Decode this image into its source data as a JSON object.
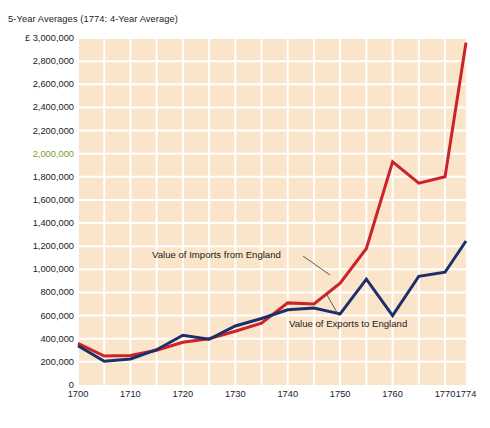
{
  "subtitle": "5-Year Averages (1774: 4-Year Average)",
  "colors": {
    "plot_background": "#fae5ca",
    "gridline": "#ffffff",
    "imports_line": "#cc2229",
    "exports_line": "#1d2f6b",
    "text": "#1b1b1b",
    "highlight_label": "#7a9b2e",
    "page_background": "#ffffff"
  },
  "axes": {
    "y_currency_prefix": "£",
    "y_ticks": [
      {
        "label": "£ 3,000,000",
        "value": 3000000,
        "highlighted": false
      },
      {
        "label": "2,800,000",
        "value": 2800000,
        "highlighted": false
      },
      {
        "label": "2,600,000",
        "value": 2600000,
        "highlighted": false
      },
      {
        "label": "2,400,000",
        "value": 2400000,
        "highlighted": false
      },
      {
        "label": "2,200,000",
        "value": 2200000,
        "highlighted": false
      },
      {
        "label": "2,000,000",
        "value": 2000000,
        "highlighted": true
      },
      {
        "label": "1,800,000",
        "value": 1800000,
        "highlighted": false
      },
      {
        "label": "1,600,000",
        "value": 1600000,
        "highlighted": false
      },
      {
        "label": "1,400,000",
        "value": 1400000,
        "highlighted": false
      },
      {
        "label": "1,200,000",
        "value": 1200000,
        "highlighted": false
      },
      {
        "label": "1,000,000",
        "value": 1000000,
        "highlighted": false
      },
      {
        "label": "800,000",
        "value": 800000,
        "highlighted": false
      },
      {
        "label": "600,000",
        "value": 600000,
        "highlighted": false
      },
      {
        "label": "400,000",
        "value": 400000,
        "highlighted": false
      },
      {
        "label": "200,000",
        "value": 200000,
        "highlighted": false
      },
      {
        "label": "0",
        "value": 0,
        "highlighted": false
      }
    ],
    "x_ticks": [
      {
        "label": "1700",
        "value": 1700
      },
      {
        "label": "1710",
        "value": 1710
      },
      {
        "label": "1720",
        "value": 1720
      },
      {
        "label": "1730",
        "value": 1730
      },
      {
        "label": "1740",
        "value": 1740
      },
      {
        "label": "1750",
        "value": 1750
      },
      {
        "label": "1760",
        "value": 1760
      },
      {
        "label": "1770",
        "value": 1770
      },
      {
        "label": "1774",
        "value": 1774
      }
    ]
  },
  "annotations": [
    {
      "id": "imports",
      "text": "Value of Imports from England"
    },
    {
      "id": "exports",
      "text": "Value of Exports to England"
    }
  ],
  "chart_data": {
    "type": "line",
    "title": "",
    "subtitle": "5-Year Averages (1774: 4-Year Average)",
    "xlabel": "",
    "ylabel": "£",
    "xlim": [
      1700,
      1774
    ],
    "ylim": [
      0,
      3000000
    ],
    "grid": true,
    "legend_position": "inline-annotations",
    "x": [
      1700,
      1705,
      1710,
      1715,
      1720,
      1725,
      1730,
      1735,
      1740,
      1745,
      1750,
      1755,
      1760,
      1765,
      1770,
      1774
    ],
    "series": [
      {
        "name": "Value of Imports from England",
        "color": "#cc2229",
        "values": [
          360000,
          250000,
          255000,
          300000,
          370000,
          400000,
          465000,
          535000,
          710000,
          700000,
          880000,
          1180000,
          1930000,
          1745000,
          1800000,
          2960000
        ]
      },
      {
        "name": "Value of Exports to England",
        "color": "#1d2f6b",
        "values": [
          340000,
          205000,
          225000,
          305000,
          430000,
          395000,
          510000,
          575000,
          650000,
          665000,
          615000,
          915000,
          600000,
          940000,
          975000,
          1245000
        ]
      }
    ]
  }
}
